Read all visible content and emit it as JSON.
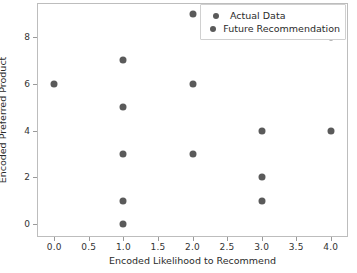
{
  "chart_data": {
    "type": "scatter",
    "title": "",
    "xlabel": "Encoded Likelihood to Recommend",
    "ylabel": "Encoded Preferred Product",
    "xlim": [
      -0.25,
      4.25
    ],
    "ylim": [
      -0.55,
      9.45
    ],
    "grid": false,
    "legend_position": "upper right",
    "xticks": [
      "0.0",
      "0.5",
      "1.0",
      "1.5",
      "2.0",
      "2.5",
      "3.0",
      "3.5",
      "4.0"
    ],
    "xtick_values": [
      0.0,
      0.5,
      1.0,
      1.5,
      2.0,
      2.5,
      3.0,
      3.5,
      4.0
    ],
    "yticks": [
      "0",
      "2",
      "4",
      "6",
      "8"
    ],
    "ytick_values": [
      0,
      2,
      4,
      6,
      8
    ],
    "marker_color": "#5a5a5a",
    "series": [
      {
        "name": "Actual Data",
        "color": "#5a5a5a",
        "points": [
          {
            "x": 0.0,
            "y": 6
          },
          {
            "x": 1.0,
            "y": 7
          },
          {
            "x": 1.0,
            "y": 5
          },
          {
            "x": 1.0,
            "y": 3
          },
          {
            "x": 1.0,
            "y": 1
          },
          {
            "x": 1.0,
            "y": 0
          },
          {
            "x": 2.0,
            "y": 9
          },
          {
            "x": 2.0,
            "y": 6
          },
          {
            "x": 2.0,
            "y": 3
          },
          {
            "x": 3.0,
            "y": 4
          },
          {
            "x": 3.0,
            "y": 2
          },
          {
            "x": 3.0,
            "y": 1
          },
          {
            "x": 4.0,
            "y": 8
          },
          {
            "x": 4.0,
            "y": 4
          }
        ]
      },
      {
        "name": "Future Recommendation",
        "color": "#5a5a5a",
        "points": []
      }
    ]
  },
  "legend": {
    "entries": [
      {
        "label": "Actual Data"
      },
      {
        "label": "Future Recommendation"
      }
    ]
  }
}
